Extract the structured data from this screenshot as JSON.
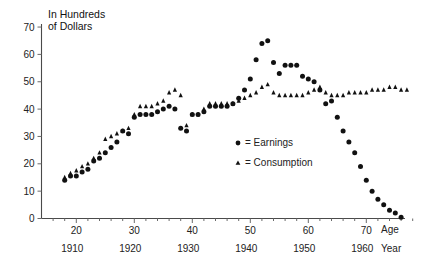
{
  "chart_data": {
    "type": "scatter",
    "title": "",
    "ylabel_lines": [
      "In Hundreds",
      "of Dollars"
    ],
    "xlabel_age": "Age",
    "xlabel_year": "Year",
    "ylim": [
      0,
      70
    ],
    "xlim": [
      14,
      79
    ],
    "grid": false,
    "legend_position": "center-right-inside",
    "y_ticks": [
      0,
      10,
      20,
      30,
      40,
      50,
      60,
      70
    ],
    "x_ticks_age": [
      20,
      30,
      40,
      50,
      60,
      70
    ],
    "x_ticks_year": [
      1910,
      1920,
      1930,
      1940,
      1950,
      1960
    ],
    "x_minor_step": 2,
    "legend": [
      {
        "marker": "circle",
        "label": "= Earnings",
        "name": "Earnings"
      },
      {
        "marker": "triangle",
        "label": "= Consumption",
        "name": "Consumption"
      }
    ],
    "series": [
      {
        "name": "Earnings",
        "marker": "circle",
        "x": [
          18,
          19,
          20,
          21,
          22,
          23,
          24,
          25,
          26,
          27,
          28,
          29,
          30,
          31,
          32,
          33,
          34,
          35,
          36,
          37,
          38,
          39,
          40,
          41,
          42,
          43,
          44,
          45,
          46,
          47,
          48,
          49,
          50,
          51,
          52,
          53,
          54,
          55,
          56,
          57,
          58,
          59,
          60,
          61,
          62,
          63,
          64,
          65,
          66,
          67,
          68,
          69,
          70,
          71,
          72,
          73,
          74,
          75,
          76
        ],
        "y": [
          14,
          15.5,
          15.5,
          17,
          18,
          21,
          22,
          24,
          26,
          28,
          32,
          31,
          37,
          38,
          38,
          38,
          39,
          40,
          41,
          40,
          33,
          32,
          38,
          38,
          39,
          41,
          41,
          41,
          41,
          42,
          44,
          47,
          51,
          58,
          64,
          65,
          57,
          53,
          56,
          56,
          56,
          52,
          51,
          50,
          47,
          42,
          43,
          37,
          32,
          28,
          24,
          19,
          14,
          10,
          7,
          5,
          3,
          2,
          0.5
        ],
        "label_note": "Earnings rise from age 18, plateau near 38-41 in the 30s, dip near age 38-39, peak 65 at age 53, decline sharply after age 62 to zero near age 76"
      },
      {
        "name": "Consumption",
        "marker": "triangle",
        "x": [
          18,
          19,
          20,
          21,
          22,
          23,
          24,
          25,
          26,
          27,
          28,
          29,
          30,
          31,
          32,
          33,
          34,
          35,
          36,
          37,
          38,
          39,
          40,
          41,
          42,
          43,
          44,
          45,
          46,
          47,
          48,
          49,
          50,
          51,
          52,
          53,
          54,
          55,
          56,
          57,
          58,
          59,
          60,
          61,
          62,
          63,
          64,
          65,
          66,
          67,
          68,
          69,
          70,
          71,
          72,
          73,
          74,
          75,
          76,
          77
        ],
        "y": [
          15,
          16.5,
          17.5,
          19,
          20,
          22,
          24,
          29,
          30,
          31,
          32,
          33,
          38,
          41,
          41,
          41,
          42,
          43,
          46,
          47,
          45,
          34,
          38,
          38,
          40,
          42,
          42,
          42,
          42,
          42,
          43,
          44,
          45,
          46,
          48,
          49,
          46,
          45,
          45,
          45,
          45,
          45,
          46,
          47,
          48,
          46,
          45,
          45,
          45,
          46,
          46,
          46,
          46,
          47,
          47,
          47,
          48,
          48,
          47,
          47
        ],
        "label_note": "Consumption tracks slightly above earnings early, dips near age 39, then stays flat around 45-48 through old age"
      }
    ]
  },
  "figure": {
    "caption": ""
  }
}
